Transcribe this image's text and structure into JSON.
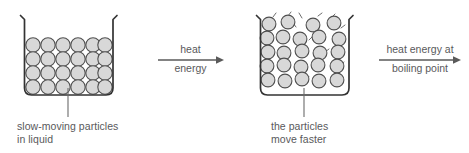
{
  "diagram": {
    "canvas": {
      "width": 469,
      "height": 153,
      "background": "#ffffff"
    },
    "colors": {
      "particle_fill": "#d8d8d8",
      "particle_stroke": "#4f4f4f",
      "beaker_stroke": "#333333",
      "text": "#59595b",
      "arrow": "#5a5a5a",
      "leader_line": "#6b6b6b"
    },
    "stages": [
      {
        "id": "beaker-1",
        "state": "liquid",
        "caption_line_1": "slow-moving particles",
        "caption_line_2": "in liquid",
        "particle_rows": 4,
        "particles_per_row": 6,
        "particle_count": 24,
        "motion_marks": false,
        "arrangement": "regular-packed"
      },
      {
        "id": "beaker-2",
        "state": "heated liquid",
        "caption_line_1": "the particles",
        "caption_line_2": "move faster",
        "particle_rows": 5,
        "particles_per_row": 6,
        "particle_count": 28,
        "motion_marks": true,
        "arrangement": "irregular-vibrating"
      }
    ],
    "arrows": [
      {
        "id": "arrow-1",
        "label_top": "heat",
        "label_bottom": "energy",
        "direction": "right"
      },
      {
        "id": "arrow-2",
        "label_top": "heat energy at",
        "label_bottom": "boiling point",
        "direction": "right"
      }
    ]
  }
}
